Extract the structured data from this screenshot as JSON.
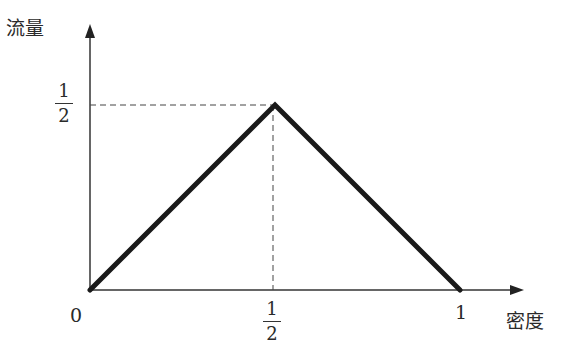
{
  "chart_data": {
    "type": "line",
    "title": "",
    "xlabel": "密度",
    "ylabel": "流量",
    "x": [
      0,
      0.5,
      1
    ],
    "series": [
      {
        "name": "流量-密度",
        "values": [
          0,
          0.5,
          0
        ]
      }
    ],
    "xticks": [
      "0",
      "1/2",
      "1"
    ],
    "yticks": [
      "1/2"
    ],
    "xlim": [
      0,
      1.15
    ],
    "ylim": [
      0,
      0.62
    ],
    "grid": false,
    "legend": "none",
    "annotations": [
      "dashed guide lines from peak (1/2, 1/2) to both axes"
    ]
  },
  "labels": {
    "y_axis": "流量",
    "x_axis": "密度",
    "origin": "0",
    "x_one": "1",
    "x_half_num": "1",
    "x_half_den": "2",
    "y_half_num": "1",
    "y_half_den": "2"
  }
}
